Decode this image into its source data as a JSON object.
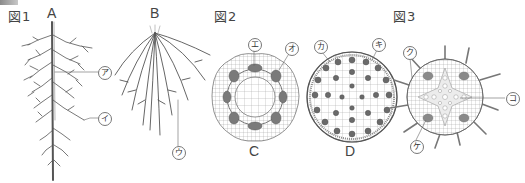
{
  "figures": {
    "fig1": {
      "title": "図1",
      "parts": {
        "A": "A",
        "B": "B"
      },
      "callouts": {
        "a": "ア",
        "i": "イ",
        "u": "ウ"
      }
    },
    "fig2": {
      "title": "図2",
      "parts": {
        "C": "C",
        "D": "D"
      },
      "callouts": {
        "e": "エ",
        "o": "オ",
        "ka": "カ",
        "ki": "キ"
      }
    },
    "fig3": {
      "title": "図3",
      "callouts": {
        "ku": "ク",
        "ke": "ケ",
        "ko": "コ"
      }
    }
  },
  "colors": {
    "line": "#555555",
    "bundle": "#6a6a6a",
    "tissue": "#9a9a9a",
    "corner_tab": "#8a8a8a"
  }
}
